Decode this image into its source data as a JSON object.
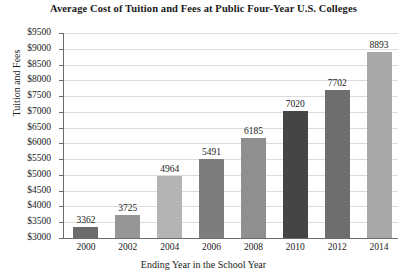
{
  "chart_data": {
    "type": "bar",
    "title": "Average Cost of Tuition and Fees at Public Four-Year U.S. Colleges",
    "xlabel": "Ending Year in the School Year",
    "ylabel": "Tuition and Fees",
    "categories": [
      "2000",
      "2002",
      "2004",
      "2006",
      "2008",
      "2010",
      "2012",
      "2014"
    ],
    "values": [
      3362,
      3725,
      4964,
      5491,
      6185,
      7020,
      7702,
      8893
    ],
    "value_labels": [
      "3362",
      "3725",
      "4964",
      "5491",
      "6185",
      "7020",
      "7702",
      "8893"
    ],
    "bar_colors": [
      "#6b6b6b",
      "#969696",
      "#b4b4b4",
      "#7d7d7d",
      "#8f8f8f",
      "#454545",
      "#6e6e6e",
      "#a8a8a8"
    ],
    "ylim": [
      3000,
      9500
    ],
    "ytick_values": [
      3000,
      3500,
      4000,
      4500,
      5000,
      5500,
      6000,
      6500,
      7000,
      7500,
      8000,
      8500,
      9000,
      9500
    ],
    "ytick_labels": [
      "$3000",
      "$3500",
      "$4000",
      "$4500",
      "$5000",
      "$5500",
      "$6000",
      "$6500",
      "$7000",
      "$7500",
      "$8000",
      "$8500",
      "$9000",
      "$9500"
    ],
    "grid": true,
    "grid_color": "#dcdcdc",
    "axis_color": "#6b6b6b",
    "legend": "none",
    "background": "#ffffff"
  }
}
